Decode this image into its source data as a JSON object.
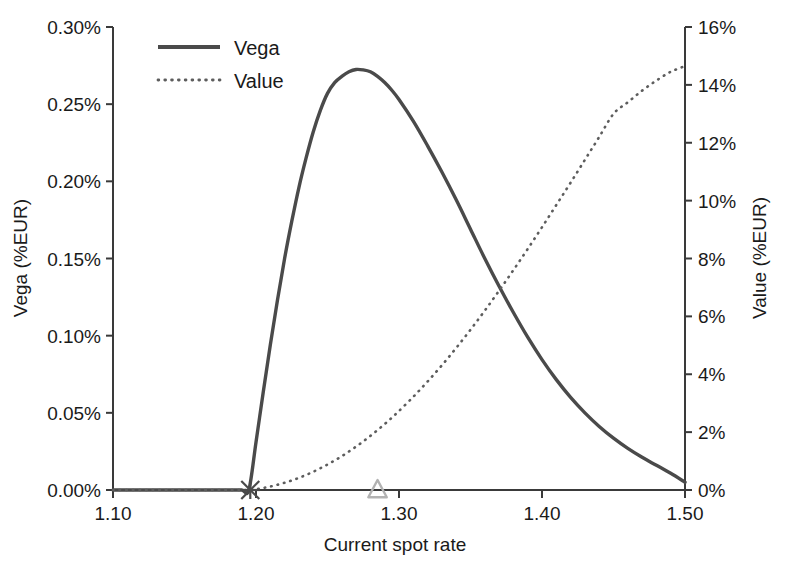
{
  "chart_data": {
    "type": "line",
    "title": "",
    "xlabel": "Current spot rate",
    "ylabel": "Vega (%EUR)",
    "y2label": "Value (%EUR)",
    "grid": false,
    "legend_position": "top-left",
    "xlim": [
      1.1,
      1.5
    ],
    "ylim": [
      0.0,
      0.3
    ],
    "y2lim": [
      0,
      16
    ],
    "xticks": [
      "1.10",
      "1.20",
      "1.30",
      "1.40",
      "1.50"
    ],
    "xtick_values": [
      1.1,
      1.2,
      1.3,
      1.4,
      1.5
    ],
    "yticks": [
      "0.00%",
      "0.05%",
      "0.10%",
      "0.15%",
      "0.20%",
      "0.25%",
      "0.30%"
    ],
    "ytick_values": [
      0.0,
      0.05,
      0.1,
      0.15,
      0.2,
      0.25,
      0.3
    ],
    "y2ticks": [
      "0%",
      "2%",
      "4%",
      "6%",
      "8%",
      "10%",
      "12%",
      "14%",
      "16%"
    ],
    "y2tick_values": [
      0,
      2,
      4,
      6,
      8,
      10,
      12,
      14,
      16
    ],
    "x": [
      1.1,
      1.12,
      1.14,
      1.16,
      1.18,
      1.19,
      1.195,
      1.2,
      1.205,
      1.21,
      1.215,
      1.22,
      1.225,
      1.23,
      1.235,
      1.24,
      1.245,
      1.25,
      1.255,
      1.26,
      1.265,
      1.27,
      1.275,
      1.28,
      1.285,
      1.29,
      1.295,
      1.3,
      1.31,
      1.32,
      1.33,
      1.34,
      1.35,
      1.36,
      1.37,
      1.38,
      1.39,
      1.4,
      1.41,
      1.42,
      1.43,
      1.44,
      1.45,
      1.46,
      1.47,
      1.48,
      1.49,
      1.5
    ],
    "series": [
      {
        "name": "Vega",
        "axis": "left",
        "units": "%EUR",
        "style": "solid",
        "color": "#4a4a4a",
        "values": [
          0.0,
          0.0,
          0.0,
          0.0,
          0.0,
          0.0,
          0.0,
          0.031,
          0.063,
          0.094,
          0.123,
          0.15,
          0.174,
          0.196,
          0.215,
          0.232,
          0.246,
          0.257,
          0.264,
          0.268,
          0.271,
          0.2725,
          0.2722,
          0.271,
          0.268,
          0.264,
          0.259,
          0.253,
          0.239,
          0.223,
          0.206,
          0.188,
          0.169,
          0.15,
          0.132,
          0.115,
          0.099,
          0.0845,
          0.0715,
          0.06,
          0.05,
          0.0412,
          0.0336,
          0.027,
          0.0212,
          0.016,
          0.0108,
          0.005
        ]
      },
      {
        "name": "Value",
        "axis": "right",
        "units": "%EUR",
        "style": "dotted",
        "color": "#5d5d5d",
        "values": [
          0.0,
          0.0,
          0.0,
          0.0,
          0.0,
          0.0,
          0.0,
          0.03,
          0.07,
          0.12,
          0.18,
          0.25,
          0.33,
          0.42,
          0.52,
          0.63,
          0.75,
          0.88,
          1.02,
          1.17,
          1.33,
          1.5,
          1.68,
          1.87,
          2.07,
          2.28,
          2.5,
          2.73,
          3.22,
          3.75,
          4.31,
          4.91,
          5.54,
          6.2,
          6.89,
          7.6,
          8.33,
          9.08,
          9.85,
          10.62,
          11.41,
          12.2,
          13.0,
          13.4,
          13.8,
          14.15,
          14.45,
          14.65
        ]
      }
    ],
    "markers": [
      {
        "name": "strike-marker",
        "symbol": "cross",
        "x": 1.196,
        "y": 0.0,
        "axis": "left",
        "color": "#4a4a4a"
      },
      {
        "name": "spot-marker",
        "symbol": "triangle",
        "x": 1.285,
        "y": 0.0,
        "axis": "left",
        "color": "#b2b2b2"
      }
    ]
  },
  "legend": {
    "items": [
      {
        "label": "Vega",
        "style": "solid"
      },
      {
        "label": "Value",
        "style": "dotted"
      }
    ]
  }
}
